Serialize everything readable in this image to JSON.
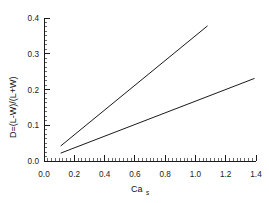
{
  "chart_data": {
    "type": "scatter",
    "title": "",
    "subtitle": "",
    "xlabel": "Ca",
    "xlabel_sub": "s",
    "ylabel": "D=(L-W)/(L+W)",
    "xlim": [
      0.0,
      1.4
    ],
    "ylim": [
      0.0,
      0.4
    ],
    "x_ticks": [
      "0.0",
      "0.2",
      "0.4",
      "0.6",
      "0.8",
      "1.0",
      "1.2",
      "1.4"
    ],
    "x_tick_values": [
      0.0,
      0.2,
      0.4,
      0.6,
      0.8,
      1.0,
      1.2,
      1.4
    ],
    "y_ticks": [
      "0.0",
      "0.1",
      "0.2",
      "0.3",
      "0.4"
    ],
    "y_tick_values": [
      0.0,
      0.1,
      0.2,
      0.3,
      0.4
    ],
    "x_minor_step": 0.025,
    "y_minor_step": 0.0125,
    "grid": false,
    "legend": false,
    "legend_position": "none",
    "series": [
      {
        "name": "filled-circles",
        "marker": "filled-circle",
        "marker_color": "#111111",
        "points": [
          {
            "x": 0.15,
            "y": 0.062,
            "yerr_low": 0.017,
            "yerr_high": 0.017
          },
          {
            "x": 0.42,
            "y": 0.105,
            "yerr_low": 0.032,
            "yerr_high": 0.034
          },
          {
            "x": 0.62,
            "y": 0.193,
            "yerr_low": 0.04,
            "yerr_high": 0.035
          },
          {
            "x": 0.86,
            "y": 0.29,
            "yerr_low": 0.026,
            "yerr_high": 0.028
          },
          {
            "x": 1.02,
            "y": 0.363,
            "yerr_low": 0.022,
            "yerr_high": 0.024
          }
        ],
        "fit": {
          "x0": 0.11,
          "y0": 0.042,
          "x1": 1.08,
          "y1": 0.378
        }
      },
      {
        "name": "open-circles",
        "marker": "open-circle",
        "marker_color": "#555555",
        "points": [
          {
            "x": 0.32,
            "y": 0.082,
            "yerr_low": 0.025,
            "yerr_high": 0.023
          },
          {
            "x": 0.78,
            "y": 0.128,
            "yerr_low": 0.038,
            "yerr_high": 0.036
          },
          {
            "x": 1.13,
            "y": 0.188,
            "yerr_low": 0.01,
            "yerr_high": 0.01
          },
          {
            "x": 1.35,
            "y": 0.224,
            "yerr_low": 0.006,
            "yerr_high": 0.006
          }
        ],
        "fit": {
          "x0": 0.11,
          "y0": 0.022,
          "x1": 1.39,
          "y1": 0.231
        }
      }
    ]
  },
  "figure": {
    "background_color": "#ffffff",
    "axis_color": "#1b1b1b",
    "line_color": "#1a1a1a"
  }
}
